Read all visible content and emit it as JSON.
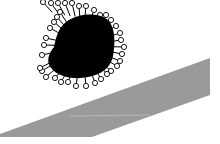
{
  "diagram": {
    "width": 220,
    "height": 144,
    "background": "#ffffff",
    "particle": {
      "core_color": "#000000",
      "core_path": "M66 22 C78 13 98 12 108 20 C116 28 115 45 113 56 C111 68 100 75 88 77 C74 80 58 77 51 68 C45 60 50 52 54 47 C56 38 58 28 66 22 Z",
      "center": [
        82,
        46
      ],
      "ligand_stroke": "#000000",
      "ligand_fill": "#ffffff",
      "ligand_head_radius": 2.6,
      "ligands": [
        [
          43,
          2
        ],
        [
          51,
          3
        ],
        [
          58,
          3
        ],
        [
          65,
          3
        ],
        [
          72,
          3
        ],
        [
          79,
          6
        ],
        [
          86,
          6
        ],
        [
          94,
          10
        ],
        [
          100,
          15
        ],
        [
          106,
          15
        ],
        [
          111,
          20
        ],
        [
          116,
          26
        ],
        [
          120,
          33
        ],
        [
          121,
          40
        ],
        [
          124,
          47
        ],
        [
          122,
          54
        ],
        [
          120,
          61
        ],
        [
          117,
          66
        ],
        [
          111,
          71
        ],
        [
          107,
          74
        ],
        [
          101,
          79
        ],
        [
          95,
          83
        ],
        [
          86,
          86
        ],
        [
          76,
          86
        ],
        [
          68,
          82
        ],
        [
          61,
          82
        ],
        [
          55,
          78
        ],
        [
          46,
          77
        ],
        [
          42,
          71
        ],
        [
          40,
          68
        ],
        [
          42,
          55
        ],
        [
          44,
          45
        ],
        [
          46,
          38
        ],
        [
          50,
          28
        ],
        [
          54,
          22
        ],
        [
          57,
          17
        ],
        [
          60,
          12
        ]
      ]
    },
    "surface": {
      "fill": "#9a9a9a",
      "points": "0,134 210,58 210,95 92,137 0,137",
      "highlight_line": {
        "x1": 70,
        "y1": 116,
        "x2": 150,
        "y2": 115,
        "color": "#c8c8c8"
      }
    }
  }
}
